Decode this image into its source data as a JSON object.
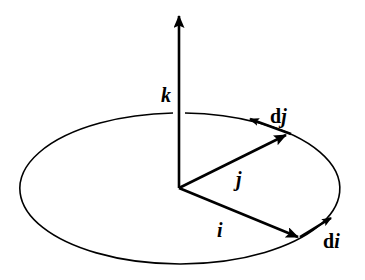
{
  "diagram": {
    "colors": {
      "background": "#ffffff",
      "stroke": "#000000"
    },
    "ellipse": {
      "cx": 180,
      "cy": 188.5,
      "rx": 160,
      "ry": 75.5,
      "gap_near_k": true
    },
    "origin": {
      "x": 179,
      "y": 188
    },
    "vectors": [
      {
        "name": "k",
        "from": [
          179,
          188
        ],
        "to": [
          179,
          14
        ]
      },
      {
        "name": "j",
        "from": [
          179,
          188
        ],
        "to": [
          287,
          134
        ]
      },
      {
        "name": "i",
        "from": [
          179,
          188
        ],
        "to": [
          299,
          237
        ]
      },
      {
        "name": "dj",
        "from": [
          290,
          134
        ],
        "to": [
          249,
          119
        ]
      },
      {
        "name": "di",
        "from": [
          300,
          237
        ],
        "to": [
          332,
          218
        ]
      }
    ],
    "labels": {
      "k": {
        "base": "",
        "sym": "k",
        "x": 162,
        "y": 101
      },
      "j": {
        "base": "",
        "sym": "j",
        "x": 238,
        "y": 187
      },
      "i": {
        "base": "",
        "sym": "i",
        "x": 218,
        "y": 236
      },
      "dj": {
        "base": "d",
        "sym": "j",
        "x": 270,
        "y": 122
      },
      "di": {
        "base": "d",
        "sym": "i",
        "x": 324,
        "y": 248
      }
    }
  }
}
